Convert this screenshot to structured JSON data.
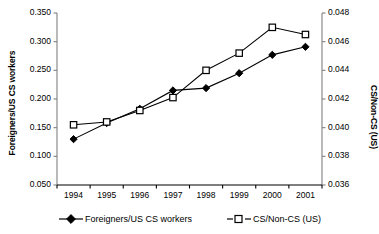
{
  "chart_data": {
    "type": "line",
    "title": "",
    "xlabel": "",
    "categories": [
      "1994",
      "1995",
      "1996",
      "1997",
      "1998",
      "1999",
      "2000",
      "2001"
    ],
    "grid": false,
    "legend_position": "bottom",
    "axes": {
      "left": {
        "label": "Foreigners/US CS workers",
        "ticks": [
          "0.050",
          "0.100",
          "0.150",
          "0.200",
          "0.250",
          "0.300",
          "0.350"
        ],
        "ylim": [
          0.05,
          0.35
        ],
        "step": 0.05
      },
      "right": {
        "label": "CS/Non-CS (US)",
        "ticks": [
          "0.036",
          "0.038",
          "0.040",
          "0.042",
          "0.044",
          "0.046",
          "0.048"
        ],
        "ylim": [
          0.036,
          0.048
        ],
        "step": 0.002
      }
    },
    "series": [
      {
        "name": "Foreigners/US CS workers",
        "axis": "left",
        "marker": "filled-diamond",
        "color": "#000000",
        "values": [
          0.13,
          0.158,
          0.183,
          0.215,
          0.219,
          0.245,
          0.277,
          0.291
        ]
      },
      {
        "name": "CS/Non-CS (US)",
        "axis": "right",
        "marker": "open-square",
        "color": "#000000",
        "values": [
          0.0402,
          0.0404,
          0.0412,
          0.0421,
          0.044,
          0.0452,
          0.047,
          0.0465
        ]
      }
    ]
  },
  "legend": {
    "items": [
      {
        "label": "Foreigners/US CS workers",
        "marker": "filled-diamond"
      },
      {
        "label": "CS/Non-CS (US)",
        "marker": "open-square"
      }
    ]
  }
}
